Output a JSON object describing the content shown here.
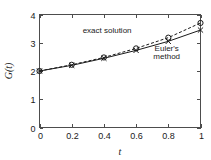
{
  "chart_data": {
    "type": "line",
    "title": "",
    "xlabel": "t",
    "ylabel": "G(t)",
    "xlim": [
      0,
      1
    ],
    "ylim": [
      0,
      4
    ],
    "grid": false,
    "legend_position": "inline-annotations",
    "x": [
      0,
      0.2,
      0.4,
      0.6,
      0.8,
      1
    ],
    "xticks": [
      "0",
      "0.2",
      "0.4",
      "0.6",
      "0.8",
      "1"
    ],
    "yticks": [
      "0",
      "1",
      "2",
      "3",
      "4"
    ],
    "series": [
      {
        "name": "exact solution",
        "style": "dashed",
        "marker": "circle",
        "values": [
          2.0,
          2.22,
          2.48,
          2.8,
          3.18,
          3.7
        ]
      },
      {
        "name": "Euler's method",
        "style": "solid",
        "marker": "x",
        "values": [
          2.0,
          2.2,
          2.45,
          2.73,
          3.05,
          3.45
        ]
      }
    ],
    "annotations": [
      {
        "text": "exact solution",
        "x": 0.42,
        "y": 3.35
      },
      {
        "text": "Euler's",
        "x": 0.79,
        "y": 2.72
      },
      {
        "text": "method",
        "x": 0.79,
        "y": 2.43
      }
    ],
    "colors": {
      "axis": "#4d4d4d",
      "exact": "#1a1a1a",
      "euler": "#1a1a1a",
      "background": "#ffffff"
    }
  },
  "annotation_text": {
    "exact_solution": "exact solution",
    "euler_line1": "Euler's",
    "euler_line2": "method"
  },
  "axis_titles": {
    "x": "t",
    "y": "G(t)"
  }
}
